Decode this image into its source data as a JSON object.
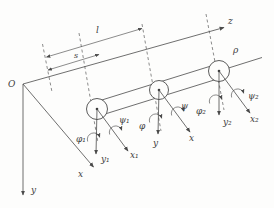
{
  "colors": {
    "ink": "#4a4a4a",
    "label": "#3d3d3d",
    "background": "#fdfdfc"
  },
  "figure": {
    "description_labels": {
      "origin": "O",
      "axis_x": "x",
      "axis_y": "y",
      "axis_z": "z",
      "dimension_total": "l",
      "dimension_running": "s",
      "shaft_axis": "ρ"
    },
    "sections": [
      {
        "x_label": "x₁",
        "y_label": "y₁",
        "phi_label": "φ₁",
        "psi_label": "ψ₁"
      },
      {
        "x_label": "x",
        "y_label": "y",
        "phi_label": "φ",
        "psi_label": "ψ"
      },
      {
        "x_label": "x₂",
        "y_label": "y₂",
        "phi_label": "φ₂",
        "psi_label": "ψ₂"
      }
    ]
  }
}
